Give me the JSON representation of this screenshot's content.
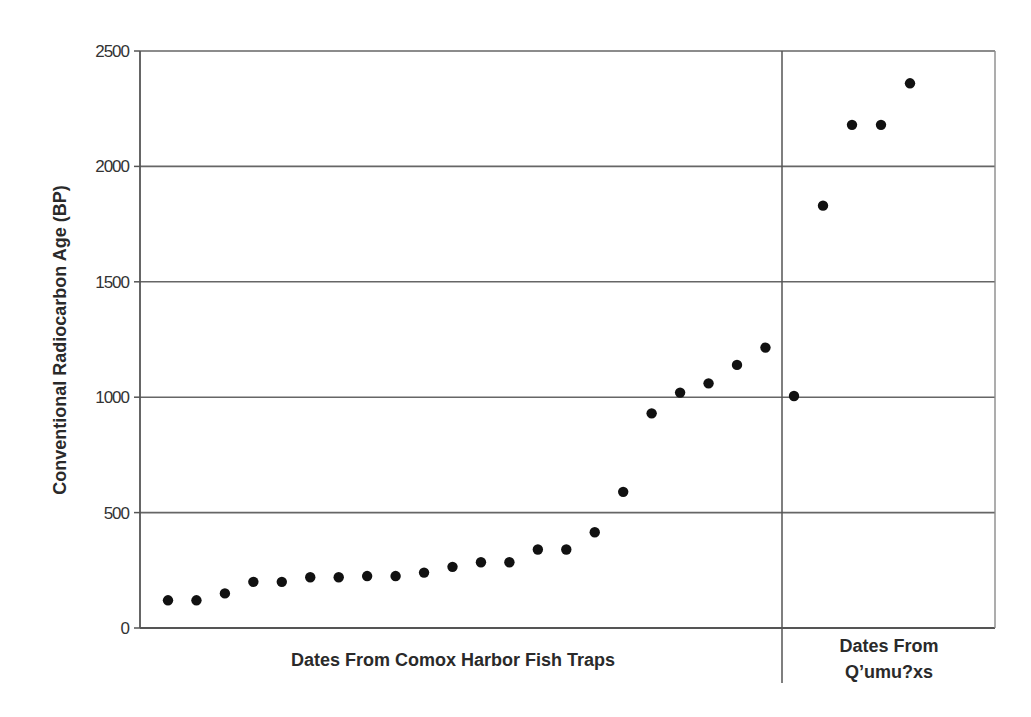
{
  "chart_data": {
    "type": "scatter",
    "title": "",
    "xlabel": "",
    "ylabel": "Conventional Radiocarbon Age (BP)",
    "ylim": [
      0,
      2500
    ],
    "yticks": [
      0,
      500,
      1000,
      1500,
      2000,
      2500
    ],
    "grid": {
      "horizontal": true,
      "vertical": false
    },
    "legend": null,
    "groups": [
      {
        "name": "Dates From Comox Harbor Fish Traps",
        "label_lines": [
          "Dates From Comox Harbor Fish Traps"
        ],
        "values": [
          120,
          120,
          150,
          200,
          200,
          220,
          220,
          225,
          225,
          240,
          265,
          285,
          285,
          340,
          340,
          415,
          590,
          930,
          1020,
          1060,
          1140,
          1215
        ]
      },
      {
        "name": "Dates From Q'umu?xs",
        "label_lines": [
          "Dates From",
          "Q’umu?xs"
        ],
        "values": [
          1005,
          1830,
          2180,
          2180,
          2360
        ]
      }
    ],
    "marker": {
      "shape": "circle",
      "color": "#111111"
    },
    "colors": {
      "axis": "#555555",
      "grid": "#666666",
      "marker": "#111111"
    }
  }
}
